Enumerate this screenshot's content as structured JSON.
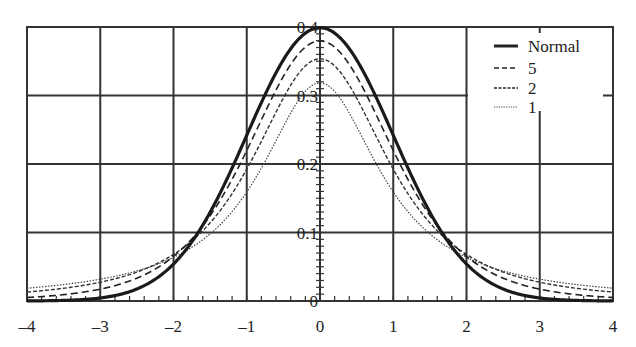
{
  "chart_data": {
    "type": "line",
    "title": "",
    "xlabel": "",
    "ylabel": "",
    "xlim": [
      -4,
      4
    ],
    "ylim": [
      0,
      0.4
    ],
    "grid": true,
    "legend_position": "upper right",
    "x_ticks": [
      "-4",
      "-3",
      "-2",
      "-1",
      "0",
      "1",
      "2",
      "3",
      "4"
    ],
    "y_ticks": [
      "0",
      "0.1",
      "0.2",
      "0.3",
      "0.4"
    ],
    "x": [
      -4,
      -3,
      -2,
      -1,
      0,
      1,
      2,
      3,
      4
    ],
    "series": [
      {
        "name": "Normal",
        "style": "solid-thick",
        "df": null,
        "values": [
          0.0001,
          0.0044,
          0.054,
          0.242,
          0.399,
          0.242,
          0.054,
          0.0044,
          0.0001
        ]
      },
      {
        "name": "5",
        "style": "dashed",
        "df": 5,
        "values": [
          0.0051,
          0.0173,
          0.0651,
          0.2197,
          0.3796,
          0.2197,
          0.0651,
          0.0173,
          0.0051
        ]
      },
      {
        "name": "2",
        "style": "dash-dot-fine",
        "df": 2,
        "values": [
          0.0131,
          0.0274,
          0.068,
          0.1925,
          0.3536,
          0.1925,
          0.068,
          0.0274,
          0.0131
        ]
      },
      {
        "name": "1",
        "style": "dotted",
        "df": 1,
        "values": [
          0.0187,
          0.0318,
          0.0637,
          0.1592,
          0.3183,
          0.1592,
          0.0637,
          0.0318,
          0.0187
        ]
      }
    ]
  },
  "legend": {
    "items": [
      {
        "label": "Normal"
      },
      {
        "label": "5"
      },
      {
        "label": "2"
      },
      {
        "label": "1"
      }
    ]
  }
}
